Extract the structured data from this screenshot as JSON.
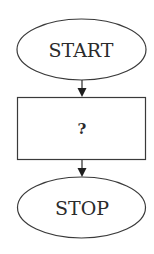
{
  "flowchart": {
    "nodes": [
      {
        "id": "start",
        "shape": "ellipse",
        "label": "START"
      },
      {
        "id": "process",
        "shape": "rectangle",
        "label": "?"
      },
      {
        "id": "stop",
        "shape": "ellipse",
        "label": "STOP"
      }
    ],
    "edges": [
      {
        "from": "start",
        "to": "process"
      },
      {
        "from": "process",
        "to": "stop"
      }
    ],
    "colors": {
      "stroke": "#3a3a3a",
      "arrow": "#1e1e1e",
      "text": "#2b2b2b",
      "background": "#ffffff"
    }
  }
}
